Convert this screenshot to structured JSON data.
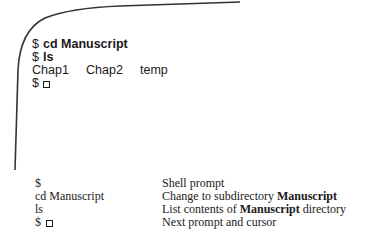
{
  "terminal": {
    "lines": [
      {
        "prompt": "$",
        "command": "cd Manuscript"
      },
      {
        "prompt": "$",
        "command": "ls"
      }
    ],
    "output_files": [
      "Chap1",
      "Chap2",
      "temp"
    ],
    "next_prompt": "$",
    "cursor_icon": "empty-square-cursor"
  },
  "legend": {
    "rows": [
      {
        "term": "$",
        "has_cursor": false,
        "desc_before": "Shell prompt",
        "desc_bold": "",
        "desc_after": ""
      },
      {
        "term": "cd Manuscript",
        "has_cursor": false,
        "desc_before": "Change to subdirectory ",
        "desc_bold": "Manuscript",
        "desc_after": ""
      },
      {
        "term": "ls",
        "has_cursor": false,
        "desc_before": "List contents of ",
        "desc_bold": "Manuscript",
        "desc_after": " directory"
      },
      {
        "term": "$",
        "has_cursor": true,
        "desc_before": "Next prompt and cursor",
        "desc_bold": "",
        "desc_after": ""
      }
    ]
  },
  "colors": {
    "ink": "#1a1a1a",
    "outline": "#333333",
    "background": "#ffffff"
  }
}
